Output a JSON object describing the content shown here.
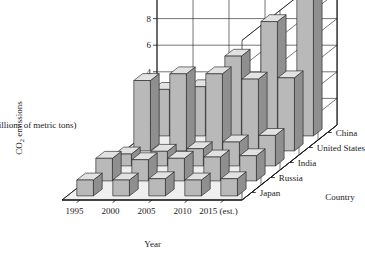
{
  "chart_data": {
    "type": "bar",
    "title": "",
    "subtitle": "",
    "xlabel": "Year",
    "ylabel": "CO₂ emissions (billions of metric tons)",
    "zlabel": "Country",
    "categories": [
      "1995",
      "2000",
      "2005",
      "2010",
      "2015 (est.)"
    ],
    "series": [
      {
        "name": "China",
        "values": [
          3.5,
          3.7,
          6.0,
          8.6,
          10.5
        ]
      },
      {
        "name": "United States",
        "values": [
          5.3,
          5.8,
          5.8,
          5.4,
          5.5
        ]
      },
      {
        "name": "India",
        "values": [
          0.9,
          1.1,
          1.3,
          1.8,
          2.3
        ]
      },
      {
        "name": "Russia",
        "values": [
          1.7,
          1.6,
          1.7,
          1.8,
          1.9
        ]
      },
      {
        "name": "Japan",
        "values": [
          1.2,
          1.2,
          1.3,
          1.2,
          1.3
        ]
      }
    ],
    "ylim": [
      0,
      12
    ],
    "yticks": [
      "0",
      "2",
      "4",
      "6",
      "8",
      "10",
      "12"
    ],
    "grid": true,
    "legend": "none",
    "colors": {
      "bar_front": "#b9b9b9",
      "bar_top": "#e2e2e2",
      "bar_side": "#8f8f8f",
      "floor": "#efefef",
      "wall": "#ffffff",
      "line": "#1a1a1a"
    }
  },
  "axes": {
    "y_label_line1": "CO",
    "y_label_sub": "2",
    "y_label_line1b": " emissions",
    "y_label_line2": "(billions of metric tons)",
    "x_label": "Year",
    "z_label": "Country"
  }
}
